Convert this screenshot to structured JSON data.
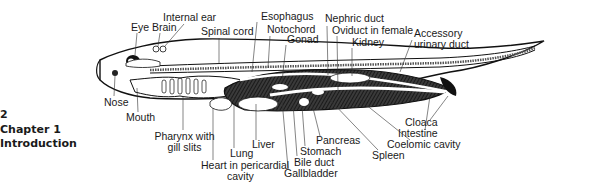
{
  "page": {
    "page_number": "2",
    "chapter": "Chapter 1",
    "section": "Introduction"
  },
  "figure": {
    "labels_top": {
      "eye": "Eye",
      "brain": "Brain",
      "internal_ear": "Internal ear",
      "spinal_cord": "Spinal cord",
      "esophagus": "Esophagus",
      "notochord": "Notochord",
      "gonad": "Gonad",
      "nephric_duct": "Nephric duct",
      "oviduct": "Oviduct in female",
      "kidney": "Kidney",
      "accessory_1": "Accessory",
      "accessory_2": "urinary duct"
    },
    "labels_bottom": {
      "nose": "Nose",
      "mouth": "Mouth",
      "pharynx_1": "Pharynx with",
      "pharynx_2": "gill slits",
      "heart_1": "Heart in pericardial",
      "heart_2": "cavity",
      "lung": "Lung",
      "liver": "Liver",
      "gallbladder": "Gallbladder",
      "bile_duct": "Bile duct",
      "stomach": "Stomach",
      "pancreas": "Pancreas",
      "spleen": "Spleen",
      "coelomic_cavity": "Coelomic cavity",
      "intestine": "Intestine",
      "cloaca": "Cloaca"
    }
  }
}
